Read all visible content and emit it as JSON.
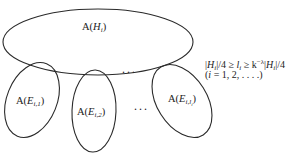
{
  "diagram": {
    "parent": {
      "label_prefix": "A(",
      "label_var": "H",
      "label_sub": "i",
      "label_suffix": ")"
    },
    "children": [
      {
        "label_prefix": "A(",
        "label_var": "E",
        "label_sub": "i,1",
        "label_suffix": ")"
      },
      {
        "label_prefix": "A(",
        "label_var": "E",
        "label_sub": "i,2",
        "label_suffix": ")"
      },
      {
        "label_prefix": "A(",
        "label_var": "E",
        "label_sub": "i,l",
        "label_sub2": "i",
        "label_suffix": ")"
      }
    ],
    "ellipsis_top": "...",
    "ellipsis_bottom": "...",
    "formula": {
      "line1": {
        "bar1": "|",
        "H": "H",
        "i1": "i",
        "part1": "|/4 ≥ ",
        "l": "l",
        "i2": "i",
        "part2": " ≥ k",
        "exp": "−λ",
        "bar2": "|",
        "H2": "H",
        "i3": "i",
        "part3": "|/4"
      },
      "line2": {
        "open": "(",
        "i": "i",
        "rest": " = 1, 2, . . . .)"
      }
    }
  }
}
